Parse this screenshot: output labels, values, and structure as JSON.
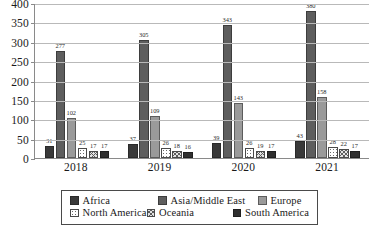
{
  "chart_data": {
    "type": "bar",
    "title": "",
    "subtitle": "",
    "xlabel": "",
    "ylabel": "",
    "categories": [
      "2018",
      "2019",
      "2020",
      "2021"
    ],
    "ylim": [
      0,
      400
    ],
    "ytick_step": 50,
    "yticks": [
      "400",
      "350",
      "300",
      "250",
      "200",
      "150",
      "100",
      "50",
      "0"
    ],
    "grid": true,
    "legend_position": "bottom",
    "series": [
      {
        "name": "Africa",
        "color": "#393939",
        "pattern": "solid",
        "values": [
          31,
          37,
          39,
          43
        ]
      },
      {
        "name": "Asia/Middle East",
        "color": "#5e5e5e",
        "pattern": "solid",
        "values": [
          277,
          305,
          343,
          380
        ]
      },
      {
        "name": "Europe",
        "color": "#9a9a9a",
        "pattern": "solid",
        "values": [
          102,
          109,
          143,
          158
        ]
      },
      {
        "name": "North America",
        "color": "#ffffff",
        "pattern": "dotted",
        "values": [
          25,
          26,
          26,
          28
        ]
      },
      {
        "name": "Oceania",
        "color": "#e2e2e2",
        "pattern": "crosshatch",
        "values": [
          17,
          18,
          19,
          22
        ]
      },
      {
        "name": "South America",
        "color": "#2f2f2f",
        "pattern": "solid",
        "values": [
          17,
          16,
          17,
          17
        ]
      }
    ]
  },
  "legend": {
    "items": [
      {
        "label": "Africa"
      },
      {
        "label": "Asia/Middle East"
      },
      {
        "label": "Europe"
      },
      {
        "label": "North America"
      },
      {
        "label": "Oceania"
      },
      {
        "label": "South America"
      }
    ]
  }
}
